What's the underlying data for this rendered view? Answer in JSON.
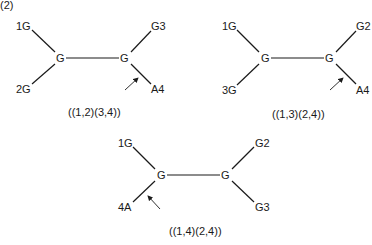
{
  "figure_label": "(2)",
  "trees": [
    {
      "caption": "((1,2)(3,4))",
      "leaves": {
        "top_left": "1G",
        "bottom_left": "2G",
        "top_right": "G3",
        "bottom_right": "A4"
      },
      "internal": {
        "left": "G",
        "right": "G"
      },
      "arrow_branch": "bottom_right"
    },
    {
      "caption": "((1,3)(2,4))",
      "leaves": {
        "top_left": "1G",
        "bottom_left": "3G",
        "top_right": "G2",
        "bottom_right": "A4"
      },
      "internal": {
        "left": "G",
        "right": "G"
      },
      "arrow_branch": "bottom_right"
    },
    {
      "caption": "((1,4)(2,4))",
      "leaves": {
        "top_left": "1G",
        "bottom_left": "4A",
        "top_right": "G2",
        "bottom_right": "G3"
      },
      "internal": {
        "left": "G",
        "right": "G"
      },
      "arrow_branch": "bottom_left"
    }
  ]
}
